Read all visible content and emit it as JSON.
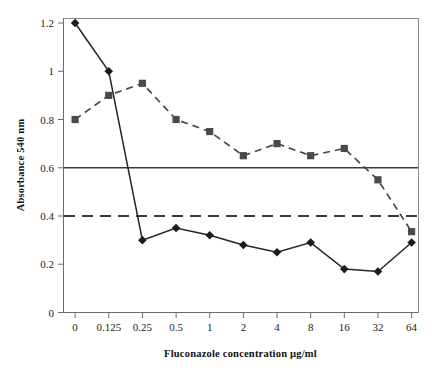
{
  "chart_data": {
    "type": "line",
    "title": "",
    "xlabel": "Fluconazole concentration µg/ml",
    "ylabel": "Absorbance 540 nm",
    "categories": [
      "0",
      "0.125",
      "0.25",
      "0.5",
      "1",
      "2",
      "4",
      "8",
      "16",
      "32",
      "64"
    ],
    "ylim": [
      0,
      1.2
    ],
    "yticks": [
      "0",
      "0.2",
      "0.4",
      "0.6",
      "0.8",
      "1",
      "1.2"
    ],
    "ytick_values": [
      0,
      0.2,
      0.4,
      0.6,
      0.8,
      1,
      1.2
    ],
    "grid": false,
    "legend": "none",
    "series": [
      {
        "name": "series-diamond-solid",
        "marker": "diamond",
        "linestyle": "solid",
        "color": "#1c1c1c",
        "values": [
          1.2,
          1.0,
          0.3,
          0.35,
          0.32,
          0.28,
          0.25,
          0.29,
          0.18,
          0.17,
          0.29
        ]
      },
      {
        "name": "series-square-dashed",
        "marker": "square",
        "linestyle": "dashed",
        "color": "#4a4a4a",
        "values": [
          0.8,
          0.9,
          0.95,
          0.8,
          0.75,
          0.65,
          0.7,
          0.65,
          0.68,
          0.55,
          0.335
        ]
      }
    ],
    "reference_lines": [
      {
        "name": "reference-line-0-6",
        "value": 0.6,
        "linestyle": "solid",
        "color": "#3b3b3b"
      },
      {
        "name": "reference-line-0-4",
        "value": 0.4,
        "linestyle": "dashed",
        "color": "#3b3b3b"
      }
    ]
  }
}
